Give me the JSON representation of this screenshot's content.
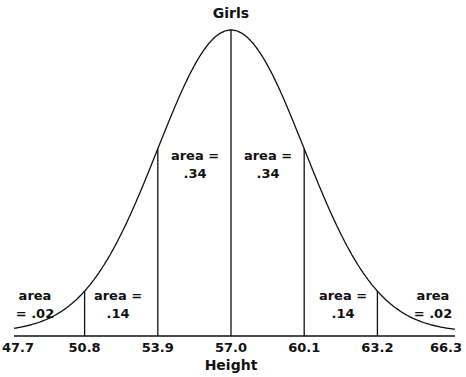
{
  "chart_data": {
    "type": "area",
    "title": "Girls",
    "xlabel": "Height",
    "ylabel": "",
    "mean": 57.0,
    "sd": 3.1,
    "x_ticks": [
      "47.7",
      "50.8",
      "53.9",
      "57.0",
      "60.1",
      "63.2",
      "66.3"
    ],
    "regions": [
      {
        "from": "47.7",
        "to": "50.8",
        "line1": "area",
        "line2": "= .02",
        "area": 0.02
      },
      {
        "from": "50.8",
        "to": "53.9",
        "line1": "area =",
        "line2": ".14",
        "area": 0.14
      },
      {
        "from": "53.9",
        "to": "57.0",
        "line1": "area =",
        "line2": ".34",
        "area": 0.34
      },
      {
        "from": "57.0",
        "to": "60.1",
        "line1": "area =",
        "line2": ".34",
        "area": 0.34
      },
      {
        "from": "60.1",
        "to": "63.2",
        "line1": "area =",
        "line2": ".14",
        "area": 0.14
      },
      {
        "from": "63.2",
        "to": "66.3",
        "line1": "area",
        "line2": "= .02",
        "area": 0.02
      }
    ],
    "grid": false,
    "legend": "none"
  }
}
